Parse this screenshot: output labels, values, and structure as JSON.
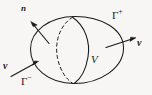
{
  "figure": {
    "background_color": "#f7f6f4",
    "stroke_color": "#1a1a1a",
    "labels": {
      "normal_vector": "n",
      "gamma_plus_base": "Γ",
      "gamma_plus_sup": "+",
      "gamma_minus_base": "Γ",
      "gamma_minus_sup": "−",
      "velocity_right": "v",
      "velocity_left": "v",
      "volume": "V"
    },
    "elements": {
      "outer_surface": "ellipse",
      "hidden_arc": "dashed-arc",
      "visible_arc": "solid-arc",
      "normal_arrow": "arrow-up-left",
      "inflow_arrow": "arrow-up-right",
      "outflow_arrow": "arrow-right"
    }
  }
}
